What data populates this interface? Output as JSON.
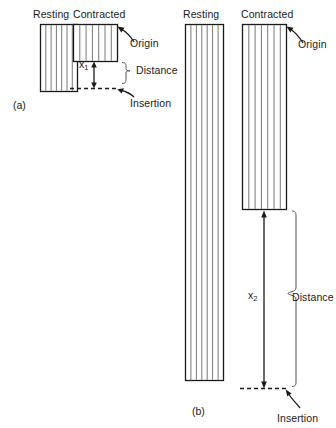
{
  "figure": {
    "background": "#ffffff",
    "ink": "#1a1a1a",
    "width": 336,
    "height": 428
  },
  "panels": [
    {
      "id": "a",
      "label": "(a)",
      "muscles": [
        {
          "name": "resting",
          "heading": "Resting",
          "shape": "striated-rectangle",
          "x": 40,
          "y": 24,
          "width": 38,
          "height": 68,
          "striations": 6
        },
        {
          "name": "contracted",
          "heading": "Contracted",
          "shape": "striated-rectangle",
          "x": 73,
          "y": 24,
          "width": 45,
          "height": 38,
          "striations": 6
        }
      ],
      "annotations": [
        {
          "name": "origin",
          "label": "Origin"
        },
        {
          "name": "distance",
          "label": "Distance"
        },
        {
          "name": "insertion",
          "label": "Insertion"
        },
        {
          "name": "displacement",
          "label": "x",
          "subscript": "1"
        }
      ]
    },
    {
      "id": "b",
      "label": "(b)",
      "muscles": [
        {
          "name": "resting",
          "heading": "Resting",
          "shape": "striated-rectangle",
          "x": 185,
          "y": 24,
          "width": 39,
          "height": 357,
          "striations": 6
        },
        {
          "name": "contracted",
          "heading": "Contracted",
          "shape": "striated-rectangle",
          "x": 242,
          "y": 24,
          "width": 45,
          "height": 186,
          "striations": 6
        }
      ],
      "annotations": [
        {
          "name": "origin",
          "label": "Origin"
        },
        {
          "name": "distance",
          "label": "Distance"
        },
        {
          "name": "insertion",
          "label": "Insertion"
        },
        {
          "name": "displacement",
          "label": "x",
          "subscript": "2"
        }
      ]
    }
  ],
  "labels": {
    "a_resting": "Resting",
    "a_contracted": "Contracted",
    "a_origin": "Origin",
    "a_distance": "Distance",
    "a_insertion": "Insertion",
    "a_x_base": "x",
    "a_x_sub": "1",
    "a_panel": "(a)",
    "b_resting": "Resting",
    "b_contracted": "Contracted",
    "b_origin": "Origin",
    "b_distance": "Distance",
    "b_insertion": "Insertion",
    "b_x_base": "x",
    "b_x_sub": "2",
    "b_panel": "(b)"
  }
}
